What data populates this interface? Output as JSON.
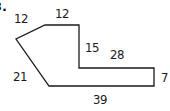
{
  "problem_number": "3.",
  "figure": {
    "type": "polygon",
    "stroke_color": "#1a1a1a",
    "fill_color": "#ffffff",
    "vertices": [
      [
        45,
        25
      ],
      [
        79,
        25
      ],
      [
        79,
        68
      ],
      [
        154,
        68
      ],
      [
        154,
        86
      ],
      [
        49,
        86
      ],
      [
        16,
        39
      ]
    ]
  },
  "labels": {
    "top_left_slant": "12",
    "top": "12",
    "inner_vertical": "15",
    "inner_horizontal": "28",
    "right": "7",
    "left_slant": "21",
    "bottom": "39"
  }
}
